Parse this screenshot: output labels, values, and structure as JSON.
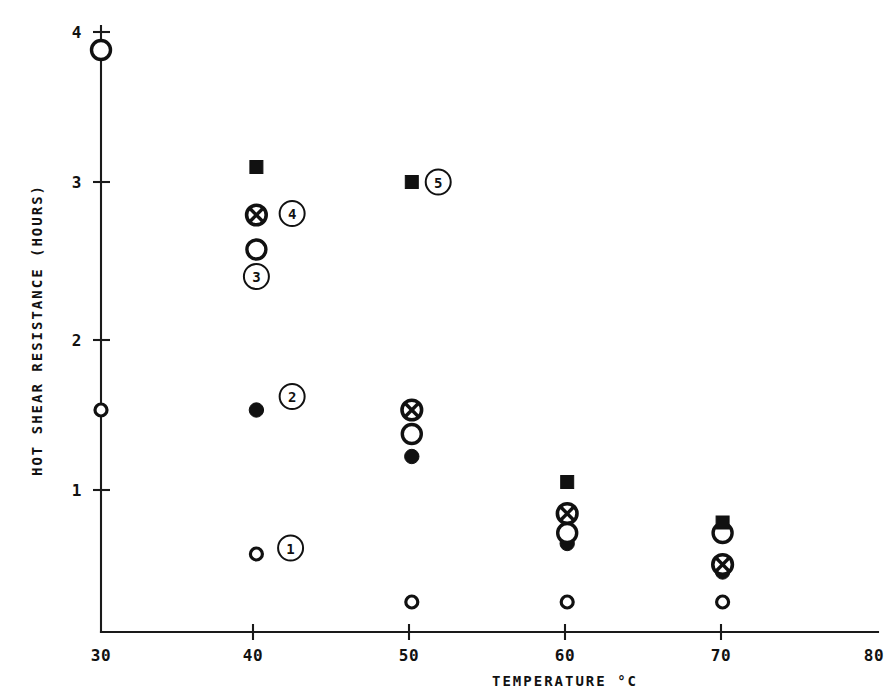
{
  "chart_data": {
    "type": "scatter",
    "title": "",
    "xlabel": "TEMPERATURE °C",
    "ylabel": "HOT SHEAR RESISTANCE (HOURS)",
    "xlim": [
      30,
      80
    ],
    "ylim": [
      0,
      4.15
    ],
    "xticks": [
      "30",
      "40",
      "50",
      "60",
      "70",
      "80"
    ],
    "xtick_values": [
      30,
      40,
      50,
      60,
      70,
      80
    ],
    "yticks": [
      "1",
      "2",
      "3",
      "4"
    ],
    "ytick_values": [
      1,
      2,
      3,
      4
    ],
    "grid": false,
    "legend": "none",
    "marker_styles": {
      "open_circle_large": "open-circle",
      "open_circle_small": "small-open-circle",
      "filled_circle": "filled-circle",
      "crossed_circle": "crossed-circle",
      "filled_square": "filled-square"
    },
    "series": [
      {
        "name": "1",
        "marker": "small-open-circle",
        "points": [
          {
            "x": 30,
            "y": 1.48
          },
          {
            "x": 40,
            "y": 0.52
          },
          {
            "x": 50,
            "y": 0.2
          },
          {
            "x": 60,
            "y": 0.2
          },
          {
            "x": 70,
            "y": 0.2
          }
        ]
      },
      {
        "name": "2",
        "marker": "filled-circle",
        "points": [
          {
            "x": 40,
            "y": 1.48
          },
          {
            "x": 50,
            "y": 1.17
          },
          {
            "x": 60,
            "y": 0.59
          },
          {
            "x": 70,
            "y": 0.4
          }
        ]
      },
      {
        "name": "3",
        "marker": "open-circle",
        "points": [
          {
            "x": 30,
            "y": 3.88
          },
          {
            "x": 40,
            "y": 2.55
          },
          {
            "x": 50,
            "y": 1.32
          },
          {
            "x": 60,
            "y": 0.66
          },
          {
            "x": 70,
            "y": 0.66
          }
        ]
      },
      {
        "name": "4",
        "marker": "crossed-circle",
        "points": [
          {
            "x": 40,
            "y": 2.78
          },
          {
            "x": 50,
            "y": 1.48
          },
          {
            "x": 60,
            "y": 0.79
          },
          {
            "x": 70,
            "y": 0.45
          }
        ]
      },
      {
        "name": "5",
        "marker": "filled-square",
        "points": [
          {
            "x": 40,
            "y": 3.1
          },
          {
            "x": 50,
            "y": 3.0
          },
          {
            "x": 60,
            "y": 1.0
          },
          {
            "x": 70,
            "y": 0.73
          }
        ]
      }
    ],
    "annotations": [
      {
        "label": "1",
        "x": 42.2,
        "y": 0.56
      },
      {
        "label": "2",
        "x": 42.3,
        "y": 1.57
      },
      {
        "label": "3",
        "x": 40.0,
        "y": 2.37
      },
      {
        "label": "4",
        "x": 42.3,
        "y": 2.79
      },
      {
        "label": "5",
        "x": 51.7,
        "y": 3.0
      }
    ]
  }
}
